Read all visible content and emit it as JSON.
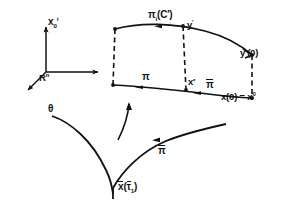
{
  "figure": {
    "background": "#ffffff",
    "ink": "#111111",
    "width": 290,
    "height": 206
  },
  "axes": {
    "name": "coordinate-frame",
    "origin_label": "R",
    "origin_superscript": "n",
    "vertical_axis_label": "x",
    "vertical_axis_subscript": "0",
    "vertical_axis_superscript": "i"
  },
  "labels": {
    "pi_c_prime": "π",
    "pi_c_prime_sub": "i",
    "pi_c_prime_arg": "(C′)",
    "y_prime": "y",
    "y_prime_mark": "′",
    "y_prime_zero": "y′(0)",
    "pi_mid": "π",
    "x_prime": "x′",
    "pi_bar_lower_mid": "π",
    "x_zero_eq": "x(0) = x",
    "x_zero_sup": "0",
    "theta": "θ",
    "pi_bar_right": "π",
    "x_bar_tau": {
      "x": "x",
      "open": "(",
      "tau": "τ",
      "tau_sub": "1",
      "close": ")"
    }
  },
  "elements": {
    "top_curve": "upper boundary curve through π(C′) to y′(0)",
    "bottom_curve": "lower boundary curve through π to x(0)",
    "left_dashed": "left vertical dashed connector",
    "mid_dashed": "middle vertical dashed connector",
    "right_dashed": "right vertical dashed connector",
    "theta_curve": "curve labelled θ descending to x̄(τ̄1)",
    "pi_bar_curve": "curve labelled π̄ ascending to the right"
  }
}
